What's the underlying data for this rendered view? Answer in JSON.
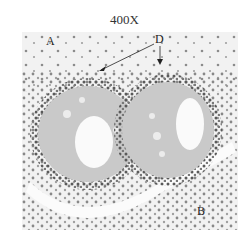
{
  "figure": {
    "magnification": "400X",
    "labels": {
      "a": "A",
      "b": "B",
      "d": "D"
    }
  }
}
